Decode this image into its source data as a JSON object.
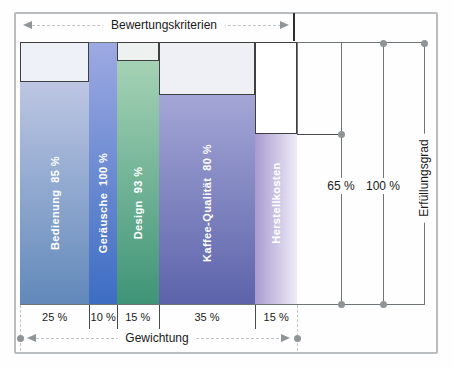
{
  "labels": {
    "criteria_axis": "Bewertungskriterien",
    "weight_axis": "Gewichtung",
    "fulfillment_axis": "Erfüllungsgrad",
    "scale_65": "65 %",
    "scale_100": "100 %"
  },
  "bars": [
    {
      "name": "bedienung",
      "label": "Bedienung  85 %",
      "criterion": "Bedienung",
      "fulfill_pct": 85,
      "weight_pct": 25,
      "weight_label": "25 %",
      "fill_from": "#bdc6e3",
      "fill_to": "#6189ba",
      "empty_fill": "#eef1f7",
      "gradient": "vertical"
    },
    {
      "name": "geraeusche",
      "label": "Geräusche  100 %",
      "criterion": "Geräusche",
      "fulfill_pct": 100,
      "weight_pct": 10,
      "weight_label": "10 %",
      "fill_from": "#9da9e2",
      "fill_to": "#3c6dc3",
      "empty_fill": "#eef1f7",
      "gradient": "vertical"
    },
    {
      "name": "design",
      "label": "Design  93 %",
      "criterion": "Design",
      "fulfill_pct": 93,
      "weight_pct": 15,
      "weight_label": "15 %",
      "fill_from": "#a5d2b5",
      "fill_to": "#3f9477",
      "empty_fill": "#edf2f1",
      "gradient": "vertical"
    },
    {
      "name": "kaffee-qualitaet",
      "label": "Kaffee-Qualität  80 %",
      "criterion": "Kaffee-Qualität",
      "fulfill_pct": 80,
      "weight_pct": 35,
      "weight_label": "35 %",
      "fill_from": "#a4a6d6",
      "fill_to": "#5c63aa",
      "empty_fill": "#eef0f6",
      "gradient": "vertical"
    },
    {
      "name": "herstellkosten",
      "label": "Herstellkosten",
      "criterion": "Herstellkosten",
      "fulfill_pct": 65,
      "weight_pct": 15,
      "weight_label": "15 %",
      "fill_from": "#a89bd0",
      "fill_to": "#efecf8",
      "empty_fill": "#ffffff",
      "gradient": "horizontal"
    }
  ],
  "chart_data": {
    "type": "bar",
    "variant": "variable-width weighted criteria profile",
    "title": "",
    "categories": [
      "Bedienung",
      "Geräusche",
      "Design",
      "Kaffee-Qualität",
      "Herstellkosten"
    ],
    "series": [
      {
        "name": "Erfüllungsgrad (%)",
        "values": [
          85,
          100,
          93,
          80,
          65
        ]
      },
      {
        "name": "Gewichtung (%)",
        "values": [
          25,
          10,
          15,
          35,
          15
        ]
      }
    ],
    "bar_width_encodes": "Gewichtung",
    "bar_height_encodes": "Erfüllungsgrad",
    "top_axis_label": "Bewertungskriterien",
    "bottom_axis_label": "Gewichtung",
    "right_axis_label": "Erfüllungsgrad",
    "right_scale_ticks": [
      "65 %",
      "100 %"
    ],
    "ylim": [
      0,
      100
    ],
    "grid": false,
    "legend": "none"
  },
  "colors": {
    "line_mid": "#6f7477",
    "line_dark": "#3f3f3f",
    "dot": "#8f9496",
    "arrow": "#8f9496",
    "frame": "#b9bdbf",
    "bar_label_text": "#ffffff"
  }
}
